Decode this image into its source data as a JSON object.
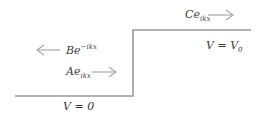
{
  "diagram": {
    "type": "potential-step",
    "line_color": "#9a9a9a",
    "arrow_color": "#a8a8a8",
    "labels": {
      "transmitted": {
        "coef": "Ce",
        "exp": "ikx",
        "direction": "right"
      },
      "reflected": {
        "coef": "Be",
        "exp": "−ikx",
        "direction": "left"
      },
      "incident": {
        "coef": "Ae",
        "exp": "ikx",
        "direction": "right"
      },
      "region_right": {
        "text": "V = V",
        "sub": "0"
      },
      "region_left": {
        "text": "V = 0"
      }
    }
  }
}
